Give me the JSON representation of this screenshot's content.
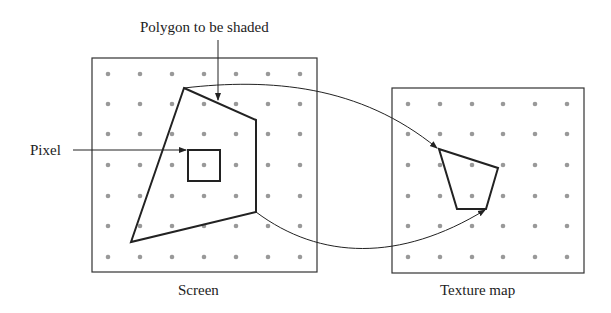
{
  "labels": {
    "title": "Polygon to be shaded",
    "pixel": "Pixel",
    "screen": "Screen",
    "texture": "Texture map"
  },
  "colors": {
    "line": "#222222",
    "dot": "#999999",
    "background": "#ffffff"
  },
  "screen": {
    "box": [
      92,
      58,
      225,
      214
    ],
    "dots_x": [
      108,
      140,
      172,
      204,
      236,
      268,
      300
    ],
    "dots_y": [
      74,
      104,
      134,
      165,
      196,
      226,
      257
    ],
    "polygon": [
      [
        184,
        88
      ],
      [
        256,
        120
      ],
      [
        256,
        212
      ],
      [
        131,
        242
      ]
    ],
    "pixel_square": [
      188,
      150,
      32,
      31
    ]
  },
  "texture": {
    "box": [
      392,
      88,
      192,
      185
    ],
    "dots_x": [
      408,
      440,
      472,
      503,
      535,
      567
    ],
    "dots_y": [
      104,
      134,
      165,
      196,
      226,
      257
    ],
    "polygon": [
      [
        439,
        149
      ],
      [
        498,
        168
      ],
      [
        486,
        209
      ],
      [
        457,
        209
      ]
    ]
  }
}
